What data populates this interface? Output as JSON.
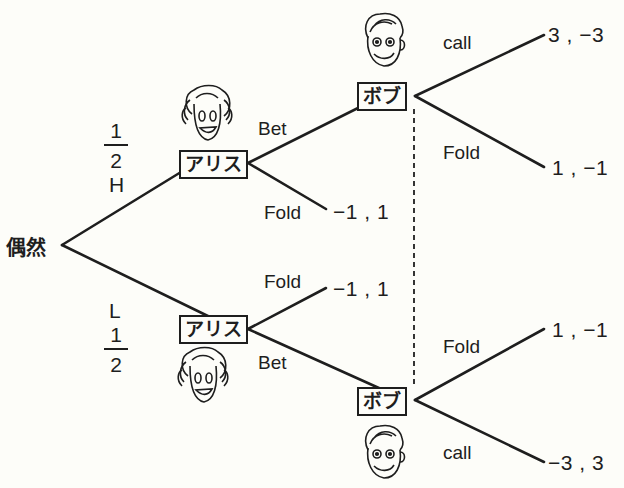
{
  "chance_node": {
    "label": "偶然"
  },
  "chance_branches": {
    "high": {
      "label": "H",
      "prob_num": "1",
      "prob_den": "2"
    },
    "low": {
      "label": "L",
      "prob_num": "1",
      "prob_den": "2"
    }
  },
  "players": {
    "alice": "アリス",
    "bob": "ボブ"
  },
  "actions": {
    "upper_alice_bet": "Bet",
    "upper_alice_fold": "Fold",
    "lower_alice_fold": "Fold",
    "lower_alice_bet": "Bet",
    "upper_bob_call": "call",
    "upper_bob_fold": "Fold",
    "lower_bob_fold": "Fold",
    "lower_bob_call": "call"
  },
  "payoffs": {
    "h_bet_call": "3 , −3",
    "h_bet_fold": "1 , −1",
    "h_fold": "−1 , 1",
    "l_fold": "−1 , 1",
    "l_bet_fold": "1 , −1",
    "l_bet_call": "−3 , 3"
  },
  "icons": {
    "alice_face": "girl-face-icon",
    "bob_face": "boy-face-icon"
  },
  "colors": {
    "ink": "#1e1e1e",
    "paper": "#fdfdf9"
  }
}
